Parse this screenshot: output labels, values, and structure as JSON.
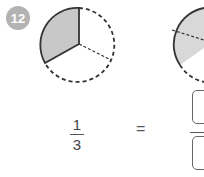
{
  "problem": {
    "number": "12",
    "left_fraction": {
      "numerator": "1",
      "denominator": "3"
    },
    "equals": "=",
    "left_pie": {
      "parts": 3,
      "shaded": 1
    },
    "right_pie": {
      "visible": "partial"
    },
    "answer_boxes": {
      "numerator": "",
      "denominator": ""
    }
  },
  "colors": {
    "badge": "#b3b3b3",
    "shade": "#c8c8c8",
    "stroke": "#333333"
  }
}
